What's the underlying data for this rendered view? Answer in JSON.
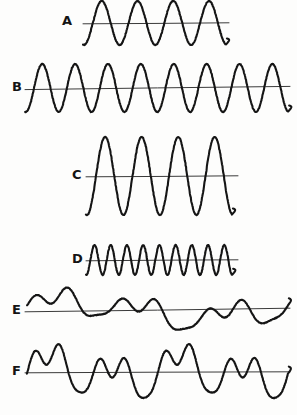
{
  "figure": {
    "background_color": "#fdfdfc",
    "stroke_color": "#151515",
    "axis_color": "#3a3a3a",
    "width": 297,
    "height": 415
  },
  "rows": [
    {
      "label": "A",
      "label_x": 62,
      "label_y": 14,
      "description": "simple periodic wave, four cycles, medium amplitude",
      "axis_y": 23,
      "axis_x1": 83,
      "axis_x2": 229,
      "wave_x1": 83,
      "wave_x2": 226,
      "cycles": 4,
      "amplitude": 22
    },
    {
      "label": "B",
      "label_x": 12,
      "label_y": 80,
      "description": "simple periodic wave, eight cycles, medium amplitude, higher frequency",
      "axis_y": 88,
      "axis_x1": 25,
      "axis_x2": 290,
      "wave_x1": 25,
      "wave_x2": 288,
      "cycles": 8,
      "amplitude": 24
    },
    {
      "label": "C",
      "label_x": 72,
      "label_y": 168,
      "description": "simple periodic wave, four cycles, large amplitude",
      "axis_y": 176,
      "axis_x1": 86,
      "axis_x2": 238,
      "wave_x1": 86,
      "wave_x2": 232,
      "cycles": 4,
      "amplitude": 39
    },
    {
      "label": "D",
      "label_x": 72,
      "label_y": 252,
      "description": "simple periodic wave, nine cycles, small amplitude, high frequency",
      "axis_y": 260,
      "axis_x1": 86,
      "axis_x2": 238,
      "wave_x1": 86,
      "wave_x2": 232,
      "cycles": 9,
      "amplitude": 15
    },
    {
      "label": "E",
      "label_x": 12,
      "label_y": 303,
      "description": "complex irregular wave, superposition of low and higher frequencies",
      "axis_y": 310,
      "axis_x1": 25,
      "axis_x2": 290,
      "wave_x1": 27,
      "wave_x2": 288,
      "cycles": 0,
      "amplitude": 20
    },
    {
      "label": "F",
      "label_x": 12,
      "label_y": 364,
      "description": "complex wave with alternating large and small peaks",
      "axis_y": 372,
      "axis_x1": 25,
      "axis_x2": 290,
      "wave_x1": 27,
      "wave_x2": 288,
      "cycles": 0,
      "amplitude": 32
    }
  ],
  "chart_data": {
    "type": "line",
    "xlabel": "",
    "ylabel": "",
    "grid": false,
    "legend": "none",
    "series": [
      {
        "name": "A",
        "kind": "sinusoid",
        "cycles": 4,
        "relative_frequency": 1,
        "relative_amplitude": 1.0,
        "x_start": 83,
        "x_end": 226,
        "baseline_y": 23,
        "amplitude_px": 22
      },
      {
        "name": "B",
        "kind": "sinusoid",
        "cycles": 8,
        "relative_frequency": 2,
        "relative_amplitude": 1.1,
        "x_start": 25,
        "x_end": 288,
        "baseline_y": 88,
        "amplitude_px": 24
      },
      {
        "name": "C",
        "kind": "sinusoid",
        "cycles": 4,
        "relative_frequency": 1,
        "relative_amplitude": 1.8,
        "x_start": 86,
        "x_end": 232,
        "baseline_y": 176,
        "amplitude_px": 39
      },
      {
        "name": "D",
        "kind": "sinusoid",
        "cycles": 9,
        "relative_frequency": 2.25,
        "relative_amplitude": 0.68,
        "x_start": 86,
        "x_end": 232,
        "baseline_y": 260,
        "amplitude_px": 15
      },
      {
        "name": "E",
        "kind": "complex",
        "cycles": 0,
        "relative_frequency": 0,
        "relative_amplitude": 0.9,
        "x_start": 27,
        "x_end": 288,
        "baseline_y": 310,
        "amplitude_px": 20
      },
      {
        "name": "F",
        "kind": "complex",
        "cycles": 0,
        "relative_frequency": 0,
        "relative_amplitude": 1.5,
        "x_start": 27,
        "x_end": 288,
        "baseline_y": 372,
        "amplitude_px": 32
      }
    ]
  }
}
